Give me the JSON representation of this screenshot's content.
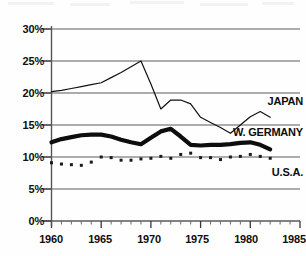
{
  "chart_data": {
    "type": "line",
    "title": "",
    "subtitle": "",
    "xlabel": "",
    "ylabel": "",
    "xlim": [
      1960,
      1985
    ],
    "ylim": [
      0,
      30
    ],
    "grid": "horizontal",
    "legend_position": "right-inline",
    "y_ticks": [
      "0%",
      "5%",
      "10%",
      "15%",
      "20%",
      "25%",
      "30%"
    ],
    "y_tick_values": [
      0,
      5,
      10,
      15,
      20,
      25,
      30
    ],
    "x_ticks": [
      "1960",
      "1965",
      "1970",
      "1975",
      "1980",
      "1985"
    ],
    "x_tick_values": [
      1960,
      1965,
      1970,
      1975,
      1980,
      1985
    ],
    "x_minor_tick_step": 1,
    "series": [
      {
        "name": "JAPAN",
        "style": "thin-line",
        "color": "#111111",
        "x": [
          1960,
          1961,
          1962,
          1963,
          1964,
          1965,
          1966,
          1967,
          1968,
          1969,
          1970,
          1971,
          1972,
          1973,
          1974,
          1975,
          1976,
          1977,
          1978,
          1979,
          1980,
          1981,
          1982
        ],
        "values": [
          20.2,
          20.4,
          20.7,
          21.0,
          21.3,
          21.6,
          22.4,
          23.2,
          24.1,
          25.0,
          21.4,
          17.5,
          18.9,
          18.9,
          18.3,
          16.2,
          15.4,
          14.6,
          13.7,
          15.0,
          16.3,
          17.1,
          16.2
        ]
      },
      {
        "name": "W. GERMANY",
        "style": "thick-line",
        "color": "#0d0d0d",
        "x": [
          1960,
          1961,
          1962,
          1963,
          1964,
          1965,
          1966,
          1967,
          1968,
          1969,
          1970,
          1971,
          1972,
          1973,
          1974,
          1975,
          1976,
          1977,
          1978,
          1979,
          1980,
          1981,
          1982
        ],
        "values": [
          12.3,
          12.8,
          13.1,
          13.4,
          13.5,
          13.5,
          13.2,
          12.7,
          12.3,
          12.0,
          13.0,
          14.0,
          14.4,
          13.2,
          11.9,
          11.8,
          11.9,
          11.9,
          12.0,
          12.2,
          12.3,
          11.9,
          11.2
        ]
      },
      {
        "name": "U.S.A.",
        "style": "dotted-markers",
        "color": "#1a1a1a",
        "x": [
          1960,
          1961,
          1962,
          1963,
          1964,
          1965,
          1966,
          1967,
          1968,
          1969,
          1970,
          1971,
          1972,
          1973,
          1974,
          1975,
          1976,
          1977,
          1978,
          1979,
          1980,
          1981,
          1982
        ],
        "values": [
          9.1,
          8.9,
          8.8,
          8.7,
          9.2,
          10.0,
          9.9,
          9.5,
          9.5,
          9.7,
          9.8,
          10.1,
          9.8,
          10.4,
          10.6,
          9.9,
          9.9,
          9.6,
          10.0,
          10.1,
          10.4,
          10.1,
          9.8
        ]
      }
    ]
  },
  "axis": {
    "y_labels": [
      "30%",
      "25%",
      "20%",
      "15%",
      "10%",
      "5%",
      "0%"
    ],
    "x_labels": [
      "1960",
      "1965",
      "1970",
      "1975",
      "1980",
      "1985"
    ]
  },
  "series_labels": {
    "japan": "JAPAN",
    "west_germany": "W. GERMANY",
    "usa": "U.S.A."
  }
}
